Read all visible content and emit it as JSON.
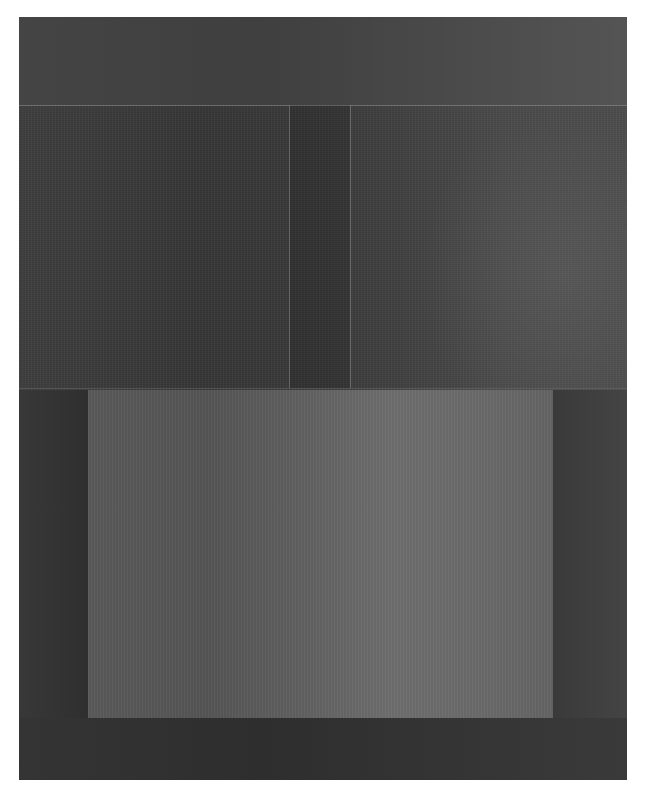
{
  "image": {
    "subject": "abstract painting on textured canvas",
    "description": "Dark gray field with a thin horizontal line near the top, two thin vertical lines in the upper-middle section, and a large lighter gray rectangle in the lower half",
    "colors": {
      "background": "#ffffff",
      "field_dark": "#3a3a3a",
      "top_band": "#454545",
      "light_rectangle": "#636363",
      "lines": "#969696",
      "bottom_band": "#303030"
    }
  }
}
